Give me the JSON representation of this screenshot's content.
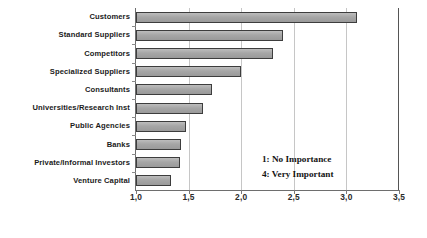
{
  "chart_data": {
    "type": "bar",
    "orientation": "horizontal",
    "title": "",
    "xlabel": "",
    "ylabel": "",
    "xlim": [
      1.0,
      3.5
    ],
    "grid": true,
    "decimal_separator": ",",
    "categories": [
      "Customers",
      "Standard Suppliers",
      "Competitors",
      "Specialized Suppliers",
      "Consultants",
      "Universities/Research Inst",
      "Public Agencies",
      "Banks",
      "Private/Informal Investors",
      "Venture Capital"
    ],
    "values": [
      3.1,
      2.4,
      2.3,
      2.0,
      1.72,
      1.64,
      1.48,
      1.43,
      1.42,
      1.33
    ],
    "xticks": [
      1.0,
      1.5,
      2.0,
      2.5,
      3.0,
      3.5
    ],
    "xticklabels": [
      "1,0",
      "1,5",
      "2,0",
      "2,5",
      "3,0",
      "3,5"
    ],
    "annotations": [
      "1: No Importance",
      "4: Very Important"
    ],
    "legend_position": "inside-lower-right",
    "colors": {
      "bar_fill": "#a8a8a8",
      "bar_border": "#3d3d3d",
      "gridline": "#c6c6c6",
      "axis": "#6e6e6e",
      "text": "#1b1b1b",
      "background": "#ffffff"
    }
  }
}
